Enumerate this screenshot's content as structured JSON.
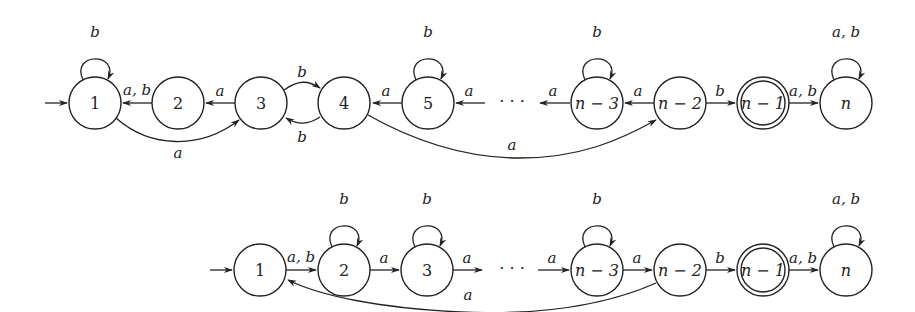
{
  "diagram": {
    "type": "finite-automata",
    "automata": [
      {
        "id": "top",
        "states": [
          {
            "id": "1",
            "label": "1",
            "x": 95,
            "y": 103,
            "initial": true,
            "accepting": false,
            "italic": false
          },
          {
            "id": "2",
            "label": "2",
            "x": 178,
            "y": 103,
            "initial": false,
            "accepting": false,
            "italic": false
          },
          {
            "id": "3",
            "label": "3",
            "x": 261,
            "y": 103,
            "initial": false,
            "accepting": false,
            "italic": false
          },
          {
            "id": "4",
            "label": "4",
            "x": 344,
            "y": 103,
            "initial": false,
            "accepting": false,
            "italic": false
          },
          {
            "id": "5",
            "label": "5",
            "x": 428,
            "y": 103,
            "initial": false,
            "accepting": false,
            "italic": false
          },
          {
            "id": "n-3",
            "label": "n − 3",
            "x": 597,
            "y": 103,
            "initial": false,
            "accepting": false,
            "italic": true
          },
          {
            "id": "n-2",
            "label": "n − 2",
            "x": 680,
            "y": 103,
            "initial": false,
            "accepting": false,
            "italic": true
          },
          {
            "id": "n-1",
            "label": "n − 1",
            "x": 763,
            "y": 103,
            "initial": false,
            "accepting": true,
            "italic": true
          },
          {
            "id": "n",
            "label": "n",
            "x": 846,
            "y": 103,
            "initial": false,
            "accepting": false,
            "italic": true
          }
        ],
        "ellipsis": {
          "label": "· · ·",
          "x": 512,
          "y": 106
        },
        "transitions": [
          {
            "from": "1",
            "to": "1",
            "label": "b",
            "kind": "loop"
          },
          {
            "from": "2",
            "to": "1",
            "label": "a, b",
            "kind": "straight"
          },
          {
            "from": "3",
            "to": "2",
            "label": "a",
            "kind": "straight"
          },
          {
            "from": "3",
            "to": "4",
            "label": "b",
            "kind": "bend-up"
          },
          {
            "from": "4",
            "to": "3",
            "label": "b",
            "kind": "bend-down"
          },
          {
            "from": "1",
            "to": "3",
            "label": "a",
            "kind": "arc-below"
          },
          {
            "from": "5",
            "to": "4",
            "label": "a",
            "kind": "straight"
          },
          {
            "from": "5",
            "to": "5",
            "label": "b",
            "kind": "loop"
          },
          {
            "from": "…",
            "to": "5",
            "label": "a",
            "kind": "straight"
          },
          {
            "from": "n-3",
            "to": "…",
            "label": "a",
            "kind": "straight"
          },
          {
            "from": "n-3",
            "to": "n-3",
            "label": "b",
            "kind": "loop"
          },
          {
            "from": "n-2",
            "to": "n-3",
            "label": "a",
            "kind": "straight"
          },
          {
            "from": "4",
            "to": "n-2",
            "label": "a",
            "kind": "arc-below"
          },
          {
            "from": "n-2",
            "to": "n-1",
            "label": "b",
            "kind": "straight"
          },
          {
            "from": "n-1",
            "to": "n",
            "label": "a, b",
            "kind": "straight"
          },
          {
            "from": "n",
            "to": "n",
            "label": "a, b",
            "kind": "loop"
          }
        ]
      },
      {
        "id": "bottom",
        "states": [
          {
            "id": "1",
            "label": "1",
            "x": 260,
            "y": 270,
            "initial": true,
            "accepting": false,
            "italic": false
          },
          {
            "id": "2",
            "label": "2",
            "x": 344,
            "y": 270,
            "initial": false,
            "accepting": false,
            "italic": false
          },
          {
            "id": "3",
            "label": "3",
            "x": 427,
            "y": 270,
            "initial": false,
            "accepting": false,
            "italic": false
          },
          {
            "id": "n-3",
            "label": "n − 3",
            "x": 597,
            "y": 270,
            "initial": false,
            "accepting": false,
            "italic": true
          },
          {
            "id": "n-2",
            "label": "n − 2",
            "x": 680,
            "y": 270,
            "initial": false,
            "accepting": false,
            "italic": true
          },
          {
            "id": "n-1",
            "label": "n − 1",
            "x": 763,
            "y": 270,
            "initial": false,
            "accepting": true,
            "italic": true
          },
          {
            "id": "n",
            "label": "n",
            "x": 846,
            "y": 270,
            "initial": false,
            "accepting": false,
            "italic": true
          }
        ],
        "ellipsis": {
          "label": "· · ·",
          "x": 512,
          "y": 273
        },
        "transitions": [
          {
            "from": "1",
            "to": "2",
            "label": "a, b",
            "kind": "straight"
          },
          {
            "from": "2",
            "to": "2",
            "label": "b",
            "kind": "loop"
          },
          {
            "from": "2",
            "to": "3",
            "label": "a",
            "kind": "straight"
          },
          {
            "from": "3",
            "to": "3",
            "label": "b",
            "kind": "loop"
          },
          {
            "from": "3",
            "to": "…",
            "label": "a",
            "kind": "straight"
          },
          {
            "from": "…",
            "to": "n-3",
            "label": "a",
            "kind": "straight"
          },
          {
            "from": "n-3",
            "to": "n-3",
            "label": "b",
            "kind": "loop"
          },
          {
            "from": "n-3",
            "to": "n-2",
            "label": "a",
            "kind": "straight"
          },
          {
            "from": "n-2",
            "to": "1",
            "label": "a",
            "kind": "arc-below"
          },
          {
            "from": "n-2",
            "to": "n-1",
            "label": "b",
            "kind": "straight"
          },
          {
            "from": "n-1",
            "to": "n",
            "label": "a, b",
            "kind": "straight"
          },
          {
            "from": "n",
            "to": "n",
            "label": "a, b",
            "kind": "loop"
          }
        ]
      }
    ],
    "labels": {
      "top": {
        "loop1": "b",
        "e21": "a, b",
        "e32": "a",
        "e34": "b",
        "e43": "b",
        "e13": "a",
        "e54": "a",
        "loop5": "b",
        "eDots5": "a",
        "eN3Dots": "a",
        "loopN3": "b",
        "eN2N3": "a",
        "e4N2": "a",
        "eN2N1": "b",
        "eN1N": "a, b",
        "loopN": "a, b"
      },
      "bottom": {
        "e12": "a, b",
        "loop2": "b",
        "e23": "a",
        "loop3": "b",
        "e3Dots": "a",
        "eDotsN3": "a",
        "loopN3": "b",
        "eN3N2": "a",
        "eN21": "a",
        "eN2N1": "b",
        "eN1N": "a, b",
        "loopN": "a, b"
      },
      "state_names": {
        "s1": "1",
        "s2": "2",
        "s3": "3",
        "s4": "4",
        "s5": "5",
        "sn3": "n − 3",
        "sn2": "n − 2",
        "sn1": "n − 1",
        "sn": "n"
      },
      "ellipsis": "· · ·"
    }
  }
}
